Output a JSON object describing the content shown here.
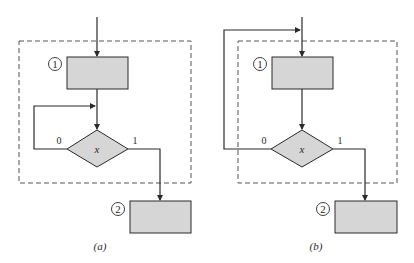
{
  "colors": {
    "stroke": "#2a2a2a",
    "fill": "#d6d6d6",
    "dash": "#555555",
    "background": "#ffffff"
  },
  "panels": [
    {
      "id": "a",
      "caption": "(a)",
      "box1_label": "1",
      "box2_label": "2",
      "decision_label": "x",
      "branch_false_label": "0",
      "branch_true_label": "1"
    },
    {
      "id": "b",
      "caption": "(b)",
      "box1_label": "1",
      "box2_label": "2",
      "decision_label": "x",
      "branch_false_label": "0",
      "branch_true_label": "1"
    }
  ]
}
